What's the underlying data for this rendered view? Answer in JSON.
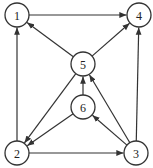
{
  "graph": {
    "type": "directed",
    "nodes": [
      {
        "id": "1",
        "label": "1",
        "x": 17,
        "y": 15
      },
      {
        "id": "4",
        "label": "4",
        "x": 139,
        "y": 15
      },
      {
        "id": "5",
        "label": "5",
        "x": 83,
        "y": 64
      },
      {
        "id": "6",
        "label": "6",
        "x": 83,
        "y": 107
      },
      {
        "id": "2",
        "label": "2",
        "x": 17,
        "y": 153
      },
      {
        "id": "3",
        "label": "3",
        "x": 136,
        "y": 153
      }
    ],
    "edges": [
      {
        "from": "1",
        "to": "4"
      },
      {
        "from": "2",
        "to": "1"
      },
      {
        "from": "5",
        "to": "1"
      },
      {
        "from": "5",
        "to": "4"
      },
      {
        "from": "3",
        "to": "4"
      },
      {
        "from": "5",
        "to": "2"
      },
      {
        "from": "6",
        "to": "2"
      },
      {
        "from": "6",
        "to": "5"
      },
      {
        "from": "3",
        "to": "5"
      },
      {
        "from": "3",
        "to": "6"
      },
      {
        "from": "2",
        "to": "3"
      }
    ],
    "node_radius": 12,
    "stroke_color": "#333333"
  }
}
